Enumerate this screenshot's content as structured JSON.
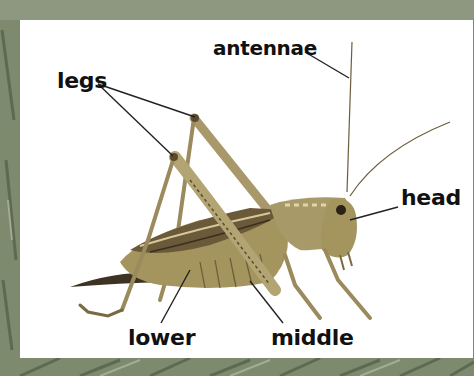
{
  "diagram": {
    "labels": {
      "antennae": "antennae",
      "legs": "legs",
      "head": "head",
      "lower": "lower",
      "middle": "middle"
    }
  },
  "colors": {
    "frame": "#7d8a6e",
    "panel": "#ffffff",
    "label_text": "#111111",
    "leader_line": "#222222",
    "insect_body": "#9a8a5c",
    "insect_dark": "#5a4a2e",
    "insect_light": "#c9b98a"
  }
}
